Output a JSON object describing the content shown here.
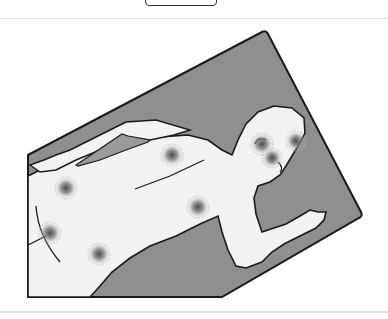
{
  "top_button": {
    "label": ""
  },
  "illustration": {
    "subject": "human-back-pain-points",
    "colors": {
      "mat": "#8f8f8f",
      "body": "#f2f2f2",
      "outline": "#1a1a1a",
      "spot": "#555555"
    },
    "pain_points": [
      {
        "id": "head-left",
        "x": 262,
        "y": 144
      },
      {
        "id": "head-right",
        "x": 296,
        "y": 141
      },
      {
        "id": "cheek",
        "x": 272,
        "y": 158
      },
      {
        "id": "upper-back",
        "x": 172,
        "y": 155
      },
      {
        "id": "left-shoulder-blade",
        "x": 66,
        "y": 188
      },
      {
        "id": "mid-back",
        "x": 198,
        "y": 207
      },
      {
        "id": "hip",
        "x": 50,
        "y": 233
      },
      {
        "id": "lower-back",
        "x": 99,
        "y": 254
      }
    ]
  }
}
